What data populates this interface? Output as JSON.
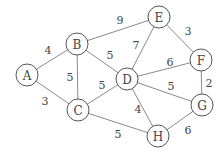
{
  "graph": {
    "nodes": [
      {
        "id": "A",
        "x": 27,
        "y": 75
      },
      {
        "id": "B",
        "x": 77,
        "y": 44
      },
      {
        "id": "C",
        "x": 78,
        "y": 110
      },
      {
        "id": "D",
        "x": 127,
        "y": 79
      },
      {
        "id": "E",
        "x": 159,
        "y": 17
      },
      {
        "id": "F",
        "x": 201,
        "y": 60
      },
      {
        "id": "G",
        "x": 202,
        "y": 105
      },
      {
        "id": "H",
        "x": 158,
        "y": 136
      }
    ],
    "edges": [
      {
        "from": "A",
        "to": "B",
        "weight": "4",
        "lx": 48,
        "ly": 50
      },
      {
        "from": "A",
        "to": "C",
        "weight": "3",
        "lx": 45,
        "ly": 101
      },
      {
        "from": "B",
        "to": "C",
        "weight": "5",
        "lx": 70,
        "ly": 77
      },
      {
        "from": "B",
        "to": "E",
        "weight": "9",
        "lx": 120,
        "ly": 20
      },
      {
        "from": "B",
        "to": "D",
        "weight": "5",
        "lx": 110,
        "ly": 55
      },
      {
        "from": "C",
        "to": "D",
        "weight": "5",
        "lx": 102,
        "ly": 85
      },
      {
        "from": "C",
        "to": "H",
        "weight": "5",
        "lx": 118,
        "ly": 134
      },
      {
        "from": "D",
        "to": "E",
        "weight": "7",
        "lx": 136,
        "ly": 45
      },
      {
        "from": "D",
        "to": "F",
        "weight": "6",
        "lx": 170,
        "ly": 62
      },
      {
        "from": "D",
        "to": "G",
        "weight": "5",
        "lx": 171,
        "ly": 86
      },
      {
        "from": "D",
        "to": "H",
        "weight": "4",
        "lx": 138,
        "ly": 109
      },
      {
        "from": "E",
        "to": "F",
        "weight": "3",
        "lx": 188,
        "ly": 31
      },
      {
        "from": "F",
        "to": "G",
        "weight": "2",
        "lx": 209,
        "ly": 83
      },
      {
        "from": "G",
        "to": "H",
        "weight": "6",
        "lx": 188,
        "ly": 130
      }
    ],
    "node_radius": 11
  }
}
